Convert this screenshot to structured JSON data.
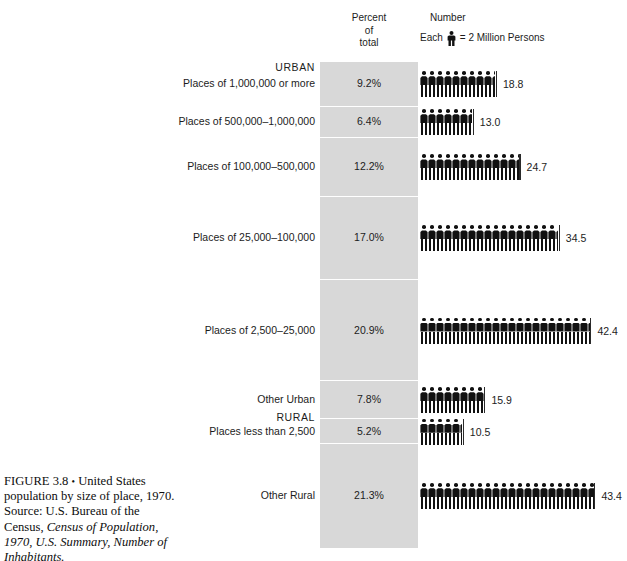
{
  "header": {
    "percent_label_line1": "Percent",
    "percent_label_line2": "of",
    "percent_label_line3": "total",
    "number_label": "Number",
    "legend_prefix": "Each",
    "legend_suffix": "= 2 Million Persons",
    "legend_icon": "person-figure-icon"
  },
  "groups": {
    "urban": "URBAN",
    "rural": "RURAL"
  },
  "caption": {
    "figure_number": "FIGURE 3.8",
    "bullet": "•",
    "title": "United States population by size of place, 1970.",
    "source_prefix": "Source: U.S. Bureau of the Census,",
    "source_italic": "Census of Population, 1970, U.S. Summary, Number of Inhabitants."
  },
  "chart_data": {
    "type": "bar",
    "title": "United States population by size of place, 1970",
    "subtitle": "",
    "xlabel": "",
    "ylabel": "",
    "unit": "millions of persons",
    "pictograph_unit_value": 2,
    "pictograph_unit_label": "Each figure = 2 Million Persons",
    "legend_position": "top-right",
    "grid": false,
    "columns": [
      "Category",
      "Percent of total",
      "Number (millions)"
    ],
    "categories": [
      "Places of 1,000,000 or more",
      "Places of 500,000–1,000,000",
      "Places of 100,000–500,000",
      "Places of 25,000–100,000",
      "Places of 2,500–25,000",
      "Other Urban",
      "Places less than 2,500",
      "Other Rural"
    ],
    "series": [
      {
        "name": "Percent of total",
        "values": [
          9.2,
          6.4,
          12.2,
          17.0,
          20.9,
          7.8,
          5.2,
          21.3
        ]
      },
      {
        "name": "Number (millions)",
        "values": [
          18.8,
          13.0,
          24.7,
          34.5,
          42.4,
          15.9,
          10.5,
          43.4
        ]
      }
    ]
  },
  "rows": [
    {
      "label": "Places of 1,000,000 or more",
      "percent": "9.2%",
      "value": "18.8",
      "figures": 9.4,
      "group": "URBAN"
    },
    {
      "label": "Places of 500,000–1,000,000",
      "percent": "6.4%",
      "value": "13.0",
      "figures": 6.5,
      "group": "URBAN"
    },
    {
      "label": "Places of 100,000–500,000",
      "percent": "12.2%",
      "value": "24.7",
      "figures": 12.35,
      "group": "URBAN"
    },
    {
      "label": "Places of 25,000–100,000",
      "percent": "17.0%",
      "value": "34.5",
      "figures": 17.25,
      "group": "URBAN"
    },
    {
      "label": "Places of 2,500–25,000",
      "percent": "20.9%",
      "value": "42.4",
      "figures": 21.2,
      "group": "URBAN"
    },
    {
      "label": "Other Urban",
      "percent": "7.8%",
      "value": "15.9",
      "figures": 7.95,
      "group": "URBAN"
    },
    {
      "label": "Places less than 2,500",
      "percent": "5.2%",
      "value": "10.5",
      "figures": 5.25,
      "group": "RURAL"
    },
    {
      "label": "Other Rural",
      "percent": "21.3%",
      "value": "43.4",
      "figures": 21.7,
      "group": "RURAL"
    }
  ],
  "colors": {
    "band_gray": "#d8d8d8",
    "figure_black": "#111111",
    "text": "#1c1c1c",
    "page_background": "#ffffff"
  }
}
